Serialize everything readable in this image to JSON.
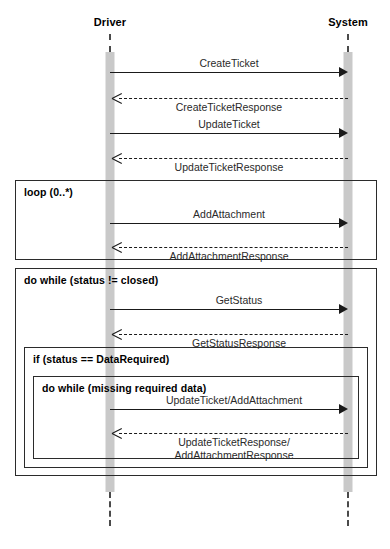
{
  "diagram": {
    "type": "sequence-diagram",
    "colors": {
      "line": "#1a1a1a",
      "fragment_border": "#2b2b2b",
      "activation_fill": "#c9c9c9",
      "lifeline": "#4a4a4a",
      "background": "#ffffff"
    }
  },
  "participants": [
    {
      "id": "driver",
      "label": "Driver",
      "x": 110
    },
    {
      "id": "system",
      "label": "System",
      "x": 348
    }
  ],
  "messages": [
    {
      "id": "m1",
      "label": "CreateTicket",
      "kind": "call",
      "direction": "right",
      "y": 72,
      "label_pos": "above"
    },
    {
      "id": "m2",
      "label": "CreateTicketResponse",
      "kind": "return",
      "direction": "left",
      "y": 98,
      "label_pos": "below"
    },
    {
      "id": "m3",
      "label": "UpdateTicket",
      "kind": "call",
      "direction": "right",
      "y": 133,
      "label_pos": "above"
    },
    {
      "id": "m4",
      "label": "UpdateTicketResponse",
      "kind": "return",
      "direction": "left",
      "y": 158,
      "label_pos": "below"
    },
    {
      "id": "m5",
      "label": "AddAttachment",
      "kind": "call",
      "direction": "right",
      "y": 223,
      "label_pos": "above"
    },
    {
      "id": "m6",
      "label": "AddAttachmentResponse",
      "kind": "return",
      "direction": "left",
      "y": 247,
      "label_pos": "below"
    },
    {
      "id": "m7",
      "label": "GetStatus",
      "kind": "call",
      "direction": "right",
      "y": 309,
      "label_pos": "above"
    },
    {
      "id": "m8",
      "label": "GetStatusResponse",
      "kind": "return",
      "direction": "left",
      "y": 334,
      "label_pos": "below"
    },
    {
      "id": "m9",
      "label": "UpdateTicket/AddAttachment",
      "kind": "call",
      "direction": "right",
      "y": 409,
      "label_pos": "above"
    },
    {
      "id": "m10",
      "label": "UpdateTicketResponse/",
      "label2": "AddAttachmentResponse",
      "kind": "return",
      "direction": "left",
      "y": 433,
      "label_pos": "below"
    }
  ],
  "fragments": [
    {
      "id": "loop",
      "label": "loop (0..*)",
      "x": 15,
      "y": 180,
      "w": 362,
      "h": 80
    },
    {
      "id": "do-while-outer",
      "label": "do while (status != closed)",
      "x": 15,
      "y": 268,
      "w": 362,
      "h": 208
    },
    {
      "id": "if-data-required",
      "label": "if  (status == DataRequired)",
      "x": 24,
      "y": 347,
      "w": 344,
      "h": 121
    },
    {
      "id": "do-while-inner",
      "label": "do while (missing required data)",
      "x": 33,
      "y": 376,
      "w": 326,
      "h": 83
    }
  ],
  "lifelines": [
    {
      "participant": "driver",
      "segments": [
        {
          "y": 34,
          "h": 18
        },
        {
          "y": 492,
          "h": 34
        }
      ]
    },
    {
      "participant": "system",
      "segments": [
        {
          "y": 34,
          "h": 18
        },
        {
          "y": 492,
          "h": 34
        }
      ]
    }
  ],
  "activations": [
    {
      "participant": "driver",
      "y": 52,
      "h": 440
    },
    {
      "participant": "system",
      "y": 52,
      "h": 440
    }
  ]
}
